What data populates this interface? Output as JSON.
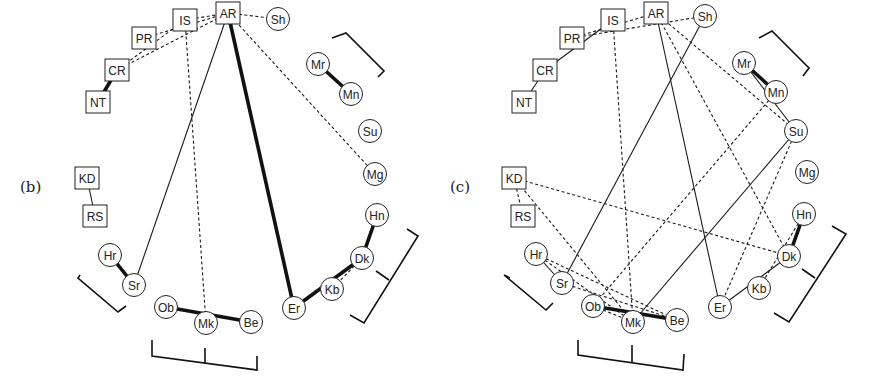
{
  "panels": [
    {
      "id": "b",
      "label": "(b)",
      "label_pos": [
        20,
        186
      ],
      "nodes": [
        {
          "id": "AR",
          "shape": "box",
          "x": 228,
          "y": 13
        },
        {
          "id": "IS",
          "shape": "box",
          "x": 185,
          "y": 20
        },
        {
          "id": "PR",
          "shape": "box",
          "x": 144,
          "y": 38
        },
        {
          "id": "CR",
          "shape": "box",
          "x": 117,
          "y": 70
        },
        {
          "id": "NT",
          "shape": "box",
          "x": 98,
          "y": 102
        },
        {
          "id": "KD",
          "shape": "box",
          "x": 87,
          "y": 178
        },
        {
          "id": "RS",
          "shape": "box",
          "x": 95,
          "y": 216
        },
        {
          "id": "Hr",
          "shape": "circle",
          "x": 110,
          "y": 255
        },
        {
          "id": "Sr",
          "shape": "circle",
          "x": 134,
          "y": 285
        },
        {
          "id": "Ob",
          "shape": "circle",
          "x": 166,
          "y": 307
        },
        {
          "id": "Mk",
          "shape": "circle",
          "x": 206,
          "y": 323
        },
        {
          "id": "Be",
          "shape": "circle",
          "x": 251,
          "y": 322
        },
        {
          "id": "Er",
          "shape": "circle",
          "x": 294,
          "y": 308
        },
        {
          "id": "Kb",
          "shape": "circle",
          "x": 332,
          "y": 289
        },
        {
          "id": "Dk",
          "shape": "circle",
          "x": 362,
          "y": 258
        },
        {
          "id": "Hn",
          "shape": "circle",
          "x": 377,
          "y": 215
        },
        {
          "id": "Mg",
          "shape": "circle",
          "x": 375,
          "y": 174
        },
        {
          "id": "Su",
          "shape": "circle",
          "x": 370,
          "y": 131
        },
        {
          "id": "Mn",
          "shape": "circle",
          "x": 351,
          "y": 94
        },
        {
          "id": "Mr",
          "shape": "circle",
          "x": 318,
          "y": 64
        },
        {
          "id": "Sh",
          "shape": "circle",
          "x": 278,
          "y": 19
        }
      ],
      "edges": [
        {
          "from": "NT",
          "to": "CR",
          "style": "thick"
        },
        {
          "from": "KD",
          "to": "RS",
          "style": "solid"
        },
        {
          "from": "Hr",
          "to": "Sr",
          "style": "thick"
        },
        {
          "from": "Mr",
          "to": "Mn",
          "style": "thick"
        },
        {
          "from": "Ob",
          "to": "Be",
          "style": "thick"
        },
        {
          "from": "AR",
          "to": "Er",
          "style": "thick"
        },
        {
          "from": "Er",
          "to": "Dk",
          "style": "thick"
        },
        {
          "from": "Dk",
          "to": "Hn",
          "style": "thick"
        },
        {
          "from": "AR",
          "to": "Sr",
          "style": "solid"
        },
        {
          "from": "Dk",
          "to": "Kb",
          "style": "dash"
        },
        {
          "from": "IS",
          "to": "Mk",
          "style": "dash"
        },
        {
          "from": "PR",
          "to": "AR",
          "style": "dash"
        },
        {
          "from": "CR",
          "to": "IS",
          "style": "dash"
        },
        {
          "from": "CR",
          "to": "AR",
          "style": "dash"
        },
        {
          "from": "AR",
          "to": "Sh",
          "style": "dash"
        },
        {
          "from": "AR",
          "to": "Mg",
          "style": "dash"
        },
        {
          "from": "IS",
          "to": "AR",
          "style": "dash"
        }
      ],
      "brackets": [
        {
          "name": "bracket-mr-mn",
          "points": [
            [
              332,
              38
            ],
            [
              346,
              33
            ],
            [
              384,
              71
            ],
            [
              378,
              77
            ]
          ]
        },
        {
          "name": "bracket-hr-sr",
          "points": [
            [
              80,
              85
            ],
            [
              78,
              88
            ],
            [
              118,
              122
            ],
            [
              126,
              116
            ]
          ],
          "offset": [
            0,
            190
          ]
        },
        {
          "name": "bracket-ob-mk-be",
          "points": [
            [
              152,
              340
            ],
            [
              152,
              356
            ],
            [
              257,
              370
            ],
            [
              257,
              356
            ]
          ],
          "tick": [
            [
              205,
              348
            ],
            [
              205,
              363
            ]
          ]
        },
        {
          "name": "bracket-dk-hn",
          "points": [
            [
              407,
              229
            ],
            [
              418,
              236
            ],
            [
              364,
              323
            ],
            [
              350,
              315
            ]
          ],
          "tick": [
            [
              376,
              271
            ],
            [
              389,
              280
            ]
          ]
        }
      ]
    },
    {
      "id": "c",
      "label": "(c)",
      "label_pos": [
        450,
        186
      ],
      "nodes": [
        {
          "id": "AR",
          "shape": "box",
          "x": 656,
          "y": 13
        },
        {
          "id": "IS",
          "shape": "box",
          "x": 613,
          "y": 20
        },
        {
          "id": "PR",
          "shape": "box",
          "x": 572,
          "y": 38
        },
        {
          "id": "CR",
          "shape": "box",
          "x": 545,
          "y": 70
        },
        {
          "id": "NT",
          "shape": "box",
          "x": 524,
          "y": 102
        },
        {
          "id": "KD",
          "shape": "box",
          "x": 514,
          "y": 178
        },
        {
          "id": "RS",
          "shape": "box",
          "x": 523,
          "y": 216
        },
        {
          "id": "Hr",
          "shape": "circle",
          "x": 536,
          "y": 254
        },
        {
          "id": "Sr",
          "shape": "circle",
          "x": 562,
          "y": 283
        },
        {
          "id": "Ob",
          "shape": "circle",
          "x": 593,
          "y": 306
        },
        {
          "id": "Mk",
          "shape": "circle",
          "x": 633,
          "y": 322
        },
        {
          "id": "Be",
          "shape": "circle",
          "x": 677,
          "y": 320
        },
        {
          "id": "Er",
          "shape": "circle",
          "x": 720,
          "y": 307
        },
        {
          "id": "Kb",
          "shape": "circle",
          "x": 759,
          "y": 288
        },
        {
          "id": "Dk",
          "shape": "circle",
          "x": 789,
          "y": 256
        },
        {
          "id": "Hn",
          "shape": "circle",
          "x": 804,
          "y": 214
        },
        {
          "id": "Mg",
          "shape": "circle",
          "x": 807,
          "y": 172
        },
        {
          "id": "Su",
          "shape": "circle",
          "x": 796,
          "y": 131
        },
        {
          "id": "Mn",
          "shape": "circle",
          "x": 776,
          "y": 92
        },
        {
          "id": "Mr",
          "shape": "circle",
          "x": 744,
          "y": 63
        },
        {
          "id": "Sh",
          "shape": "circle",
          "x": 705,
          "y": 16
        }
      ],
      "edges": [
        {
          "from": "NT",
          "to": "CR",
          "style": "solid"
        },
        {
          "from": "CR",
          "to": "IS",
          "style": "solid"
        },
        {
          "from": "KD",
          "to": "RS",
          "style": "dash"
        },
        {
          "from": "Hr",
          "to": "Sr",
          "style": "solid"
        },
        {
          "from": "Mr",
          "to": "Mn",
          "style": "thick"
        },
        {
          "from": "Ob",
          "to": "Be",
          "style": "thick"
        },
        {
          "from": "Dk",
          "to": "Hn",
          "style": "thick"
        },
        {
          "from": "Sh",
          "to": "Sr",
          "style": "solid"
        },
        {
          "from": "AR",
          "to": "Er",
          "style": "solid"
        },
        {
          "from": "Mr",
          "to": "Su",
          "style": "solid"
        },
        {
          "from": "Su",
          "to": "Mk",
          "style": "solid"
        },
        {
          "from": "Er",
          "to": "Dk",
          "style": "solid"
        },
        {
          "from": "PR",
          "to": "AR",
          "style": "dash"
        },
        {
          "from": "PR",
          "to": "Sh",
          "style": "dash"
        },
        {
          "from": "IS",
          "to": "Mk",
          "style": "dash"
        },
        {
          "from": "AR",
          "to": "Su",
          "style": "dash"
        },
        {
          "from": "AR",
          "to": "Dk",
          "style": "dash"
        },
        {
          "from": "Mn",
          "to": "Ob",
          "style": "dash"
        },
        {
          "from": "Su",
          "to": "Er",
          "style": "dash"
        },
        {
          "from": "KD",
          "to": "Dk",
          "style": "dash"
        },
        {
          "from": "KD",
          "to": "Mk",
          "style": "dash"
        },
        {
          "from": "Hr",
          "to": "Be",
          "style": "dash"
        },
        {
          "from": "Hr",
          "to": "Mk",
          "style": "dash"
        },
        {
          "from": "Sr",
          "to": "Be",
          "style": "dash"
        },
        {
          "from": "Ob",
          "to": "Mk",
          "style": "dash"
        },
        {
          "from": "Hn",
          "to": "Kb",
          "style": "dash"
        }
      ],
      "brackets": [
        {
          "name": "bracket-mr-mn",
          "points": [
            [
              759,
              38
            ],
            [
              772,
              31
            ],
            [
              809,
              68
            ],
            [
              803,
              76
            ]
          ]
        },
        {
          "name": "bracket-hr-sr",
          "points": [
            [
              510,
              278
            ],
            [
              504,
              275
            ],
            [
              546,
              310
            ],
            [
              553,
              303
            ]
          ]
        },
        {
          "name": "bracket-ob-mk-be",
          "points": [
            [
              578,
              340
            ],
            [
              578,
              355
            ],
            [
              683,
              370
            ],
            [
              684,
              354
            ]
          ],
          "tick": [
            [
              632,
              345
            ],
            [
              632,
              362
            ]
          ]
        },
        {
          "name": "bracket-dk-hn",
          "points": [
            [
              832,
              226
            ],
            [
              846,
              234
            ],
            [
              789,
              322
            ],
            [
              774,
              313
            ]
          ],
          "tick": [
            [
              802,
              269
            ],
            [
              815,
              278
            ]
          ]
        }
      ]
    }
  ]
}
